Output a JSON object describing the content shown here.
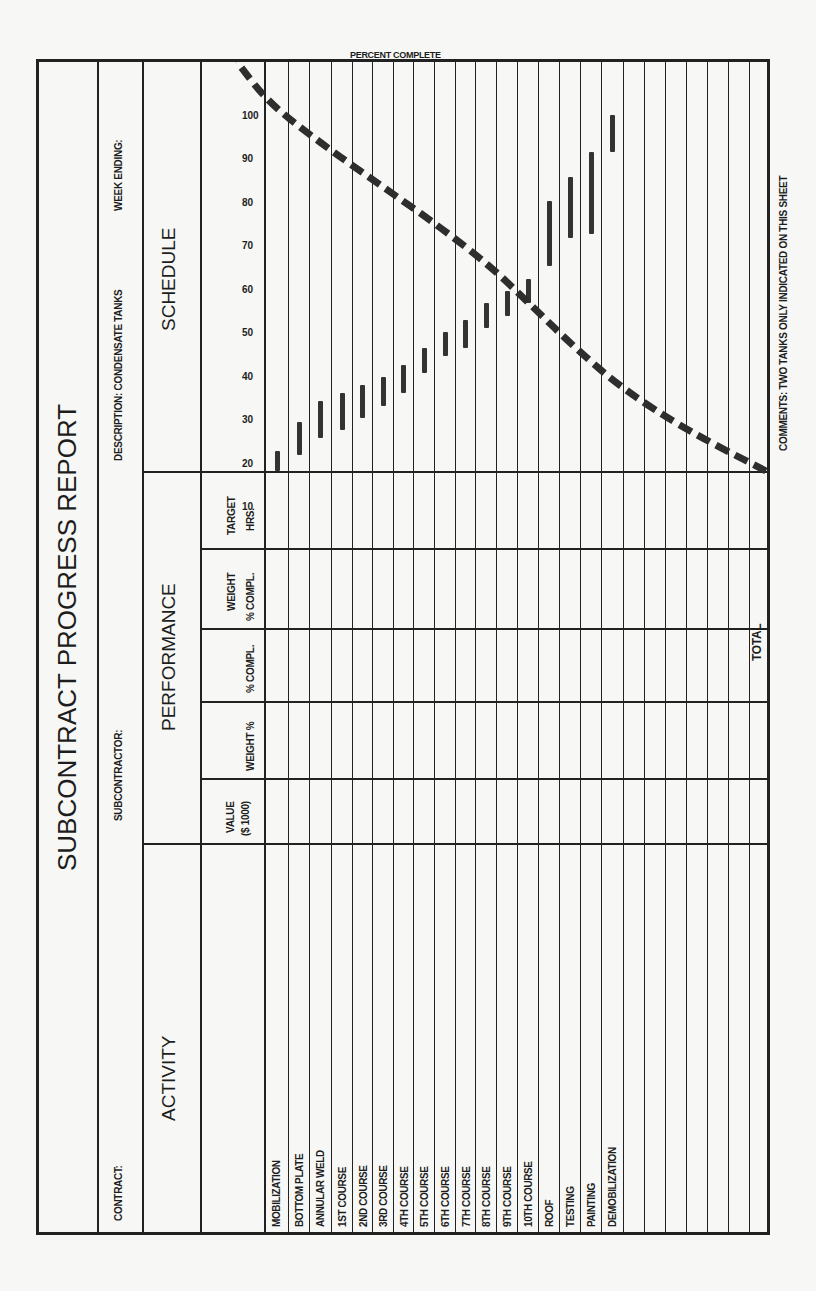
{
  "form": {
    "title": "SUBCONTRACT PROGRESS REPORT",
    "contract_label": "CONTRACT:",
    "subcontractor_label": "SUBCONTRACTOR:",
    "description_label": "DESCRIPTION: CONDENSATE TANKS",
    "week_ending_label": "WEEK ENDING:",
    "activity_header": "ACTIVITY",
    "performance_header": "PERFORMANCE",
    "schedule_header": "SCHEDULE",
    "columns": {
      "value": "VALUE",
      "value_unit": "($ 1000)",
      "weight_pct": "WEIGHT %",
      "pct_compl": "% COMPL.",
      "weight_compl_1": "WEIGHT",
      "weight_compl_2": "% COMPL.",
      "target_1": "TARGET",
      "target_2": "HRS."
    },
    "activities": [
      "MOBILIZATION",
      "BOTTOM PLATE",
      "ANNULAR WELD",
      "1ST COURSE",
      "2ND COURSE",
      "3RD COURSE",
      "4TH COURSE",
      "5TH COURSE",
      "6TH COURSE",
      "7TH COURSE",
      "8TH COURSE",
      "9TH COURSE",
      "10TH COURSE",
      "ROOF",
      "TESTING",
      "PAINTING",
      "DEMOBILIZATION",
      "",
      "",
      "",
      "",
      ""
    ],
    "total_label": "TOTAL",
    "percent_axis_label": "PERCENT COMPLETE",
    "percent_ticks": [
      "100",
      "90",
      "80",
      "70",
      "60",
      "50",
      "40",
      "30",
      "20",
      "10"
    ],
    "comments": "COMMENTS: TWO TANKS ONLY INDICATED ON THIS SHEET"
  },
  "chart_data": {
    "type": "gantt+line",
    "title": "SCHEDULE",
    "ylabel": "PERCENT COMPLETE",
    "ylim": [
      0,
      100
    ],
    "categories": [
      "MOBILIZATION",
      "BOTTOM PLATE",
      "ANNULAR WELD",
      "1ST COURSE",
      "2ND COURSE",
      "3RD COURSE",
      "4TH COURSE",
      "5TH COURSE",
      "6TH COURSE",
      "7TH COURSE",
      "8TH COURSE",
      "9TH COURSE",
      "10TH COURSE",
      "ROOF",
      "TESTING",
      "PAINTING",
      "DEMOBILIZATION"
    ],
    "bars_time_position_pct": [
      {
        "start": 0,
        "end": 5
      },
      {
        "start": 4,
        "end": 12
      },
      {
        "start": 8,
        "end": 17
      },
      {
        "start": 10,
        "end": 19
      },
      {
        "start": 13,
        "end": 21
      },
      {
        "start": 16,
        "end": 23
      },
      {
        "start": 19,
        "end": 26
      },
      {
        "start": 24,
        "end": 30
      },
      {
        "start": 28,
        "end": 34
      },
      {
        "start": 30,
        "end": 37
      },
      {
        "start": 35,
        "end": 41
      },
      {
        "start": 38,
        "end": 44
      },
      {
        "start": 41,
        "end": 47
      },
      {
        "start": 50,
        "end": 66
      },
      {
        "start": 57,
        "end": 72
      },
      {
        "start": 58,
        "end": 78
      },
      {
        "start": 78,
        "end": 87
      }
    ],
    "s_curve": {
      "name": "Planned cumulative % complete",
      "style": "dashed",
      "points_pct": [
        [
          0,
          0
        ],
        [
          10,
          15
        ],
        [
          20,
          27
        ],
        [
          30,
          36
        ],
        [
          40,
          44
        ],
        [
          50,
          52
        ],
        [
          60,
          62
        ],
        [
          70,
          73
        ],
        [
          80,
          84
        ],
        [
          90,
          94
        ],
        [
          100,
          100
        ]
      ]
    }
  }
}
